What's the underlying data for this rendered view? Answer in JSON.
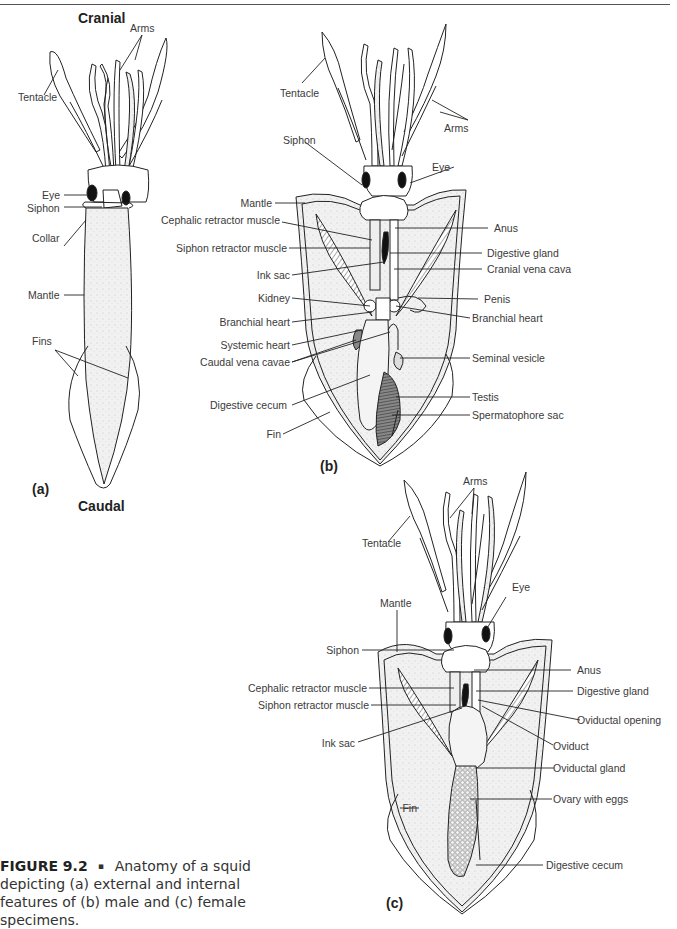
{
  "header_rule": true,
  "panel_a": {
    "top_label": "Cranial",
    "bottom_label": "Caudal",
    "panel_id": "(a)",
    "labels": {
      "arms": "Arms",
      "tentacle": "Tentacle",
      "eye": "Eye",
      "siphon": "Siphon",
      "collar": "Collar",
      "mantle": "Mantle",
      "fins": "Fins"
    }
  },
  "panel_b": {
    "panel_id": "(b)",
    "labels": {
      "tentacle": "Tentacle",
      "arms": "Arms",
      "siphon": "Siphon",
      "eye": "Eye",
      "mantle": "Mantle",
      "cephalic_retractor_muscle": "Cephalic retractor muscle",
      "siphon_retractor_muscle": "Siphon retractor muscle",
      "ink_sac": "Ink sac",
      "kidney": "Kidney",
      "branchial_heart_left": "Branchial heart",
      "systemic_heart": "Systemic heart",
      "caudal_vena_cavae": "Caudal vena cavae",
      "digestive_cecum": "Digestive cecum",
      "fin": "Fin",
      "anus": "Anus",
      "digestive_gland": "Digestive gland",
      "cranial_vena_cava": "Cranial vena cava",
      "penis": "Penis",
      "branchial_heart_right": "Branchial heart",
      "seminal_vesicle": "Seminal vesicle",
      "testis": "Testis",
      "spermatophore_sac": "Spermatophore sac"
    }
  },
  "panel_c": {
    "panel_id": "(c)",
    "labels": {
      "arms": "Arms",
      "tentacle": "Tentacle",
      "eye": "Eye",
      "mantle": "Mantle",
      "siphon": "Siphon",
      "cephalic_retractor_muscle": "Cephalic retractor muscle",
      "siphon_retractor_muscle": "Siphon retractor muscle",
      "ink_sac": "Ink sac",
      "fin": "Fin",
      "anus": "Anus",
      "digestive_gland": "Digestive gland",
      "oviductal_opening": "Oviductal opening",
      "oviduct": "Oviduct",
      "oviductal_gland": "Oviductal gland",
      "ovary_with_eggs": "Ovary with eggs",
      "digestive_cecum": "Digestive cecum"
    }
  },
  "caption": {
    "figure_number": "FIGURE 9.2",
    "separator": "▪",
    "text": "Anatomy of a squid depicting (a) external and internal features of (b) male and (c) female specimens."
  }
}
